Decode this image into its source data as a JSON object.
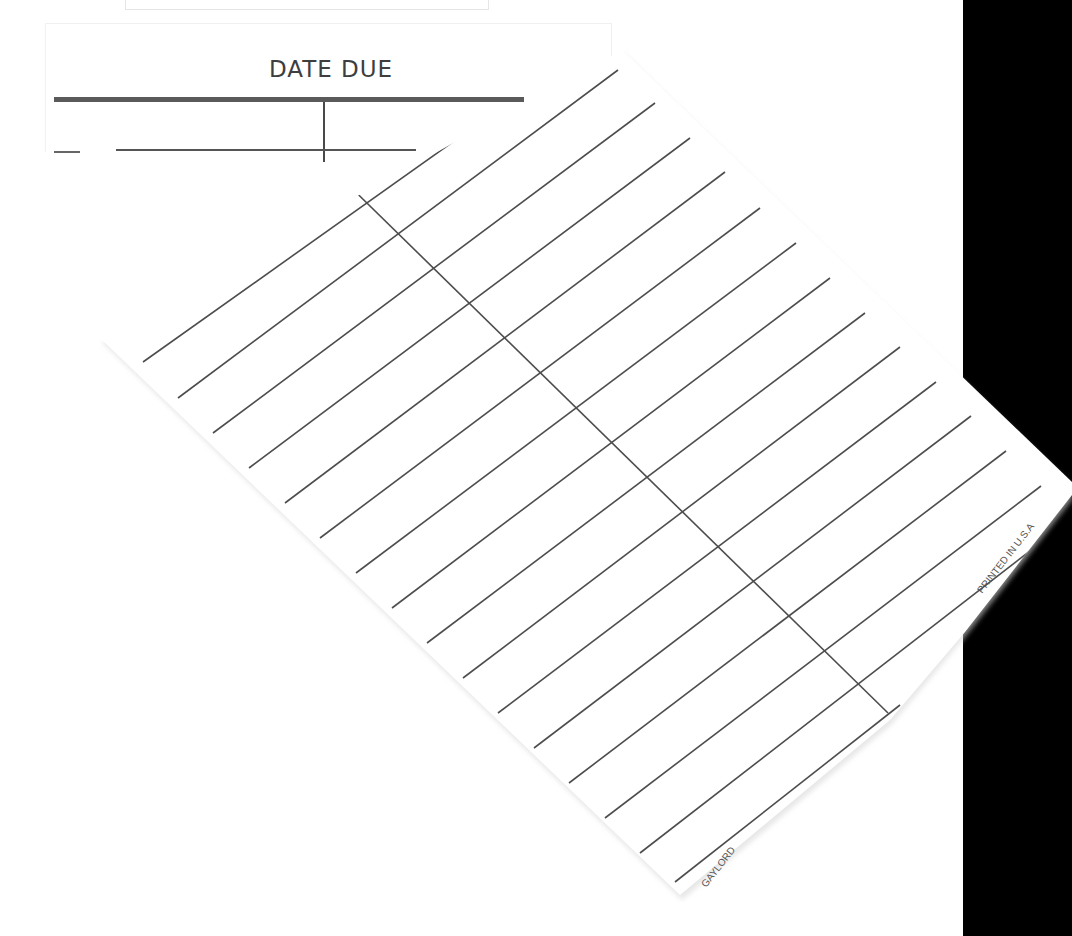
{
  "slip": {
    "title": "DATE DUE",
    "columns": 2,
    "rows_visible": 1
  },
  "card": {
    "rotation_deg": -40,
    "ruled_lines": 20,
    "column_divider": true,
    "imprint_right": "PRINTED IN U.S.A",
    "imprint_bottom": "GAYLORD"
  },
  "colors": {
    "background": "#ffffff",
    "ink": "#4a4a4a",
    "panel": "#000000"
  }
}
